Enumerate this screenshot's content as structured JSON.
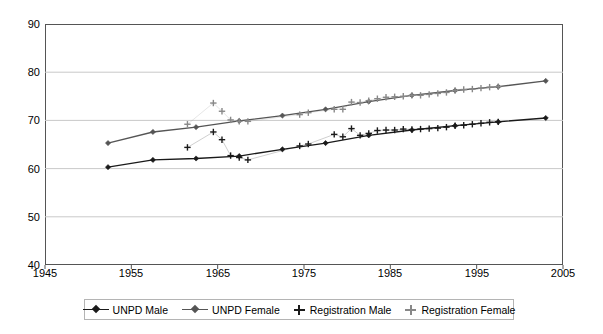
{
  "chart_data": {
    "type": "line",
    "title": "",
    "xlabel": "",
    "ylabel": "",
    "xlim": [
      1945,
      2005
    ],
    "ylim": [
      40,
      90
    ],
    "xticks": [
      1945,
      1955,
      1965,
      1975,
      1985,
      1995,
      2005
    ],
    "yticks": [
      40,
      50,
      60,
      70,
      80,
      90
    ],
    "grid": "horizontal",
    "legend_position": "bottom",
    "series": [
      {
        "name": "UNPD Male",
        "marker": "diamond",
        "color": "#1a1a1a",
        "style": "line+marker",
        "points": [
          [
            1952.3,
            60.3
          ],
          [
            1957.5,
            61.8
          ],
          [
            1962.5,
            62.1
          ],
          [
            1967.5,
            62.6
          ],
          [
            1972.5,
            64.0
          ],
          [
            1977.5,
            65.3
          ],
          [
            1982.5,
            66.9
          ],
          [
            1987.5,
            68.0
          ],
          [
            1992.5,
            68.9
          ],
          [
            1997.5,
            69.7
          ],
          [
            2003.0,
            70.5
          ]
        ]
      },
      {
        "name": "UNPD Female",
        "marker": "diamond",
        "color": "#555555",
        "style": "line+marker",
        "points": [
          [
            1952.3,
            65.3
          ],
          [
            1957.5,
            67.6
          ],
          [
            1962.5,
            68.6
          ],
          [
            1967.5,
            69.9
          ],
          [
            1972.5,
            71.0
          ],
          [
            1977.5,
            72.3
          ],
          [
            1982.5,
            73.9
          ],
          [
            1987.5,
            75.2
          ],
          [
            1992.5,
            76.2
          ],
          [
            1997.5,
            77.0
          ],
          [
            2003.0,
            78.2
          ]
        ]
      },
      {
        "name": "Registration Male",
        "marker": "plus",
        "color": "#1a1a1a",
        "style": "marker+thinline",
        "points": [
          [
            1961.5,
            64.4
          ],
          [
            1964.5,
            67.6
          ],
          [
            1965.5,
            66.0
          ],
          [
            1966.5,
            62.7
          ],
          [
            1967.5,
            62.3
          ],
          [
            1968.5,
            61.8
          ],
          [
            1974.5,
            64.7
          ],
          [
            1975.5,
            65.1
          ],
          [
            1978.5,
            67.1
          ],
          [
            1979.5,
            66.6
          ],
          [
            1980.5,
            68.3
          ],
          [
            1981.5,
            66.9
          ],
          [
            1982.5,
            67.3
          ],
          [
            1983.5,
            67.9
          ],
          [
            1984.5,
            68.0
          ],
          [
            1985.5,
            68.0
          ],
          [
            1986.5,
            68.2
          ],
          [
            1987.5,
            68.1
          ],
          [
            1988.5,
            68.2
          ],
          [
            1989.5,
            68.3
          ],
          [
            1990.5,
            68.4
          ],
          [
            1991.5,
            68.6
          ],
          [
            1992.5,
            68.9
          ],
          [
            1993.5,
            69.0
          ],
          [
            1994.5,
            69.2
          ],
          [
            1995.5,
            69.4
          ],
          [
            1996.5,
            69.6
          ],
          [
            1997.5,
            69.7
          ]
        ]
      },
      {
        "name": "Registration Female",
        "marker": "plus",
        "color": "#888888",
        "style": "marker+thinline",
        "points": [
          [
            1961.5,
            69.2
          ],
          [
            1964.5,
            73.6
          ],
          [
            1965.5,
            71.9
          ],
          [
            1966.5,
            70.1
          ],
          [
            1967.5,
            69.8
          ],
          [
            1968.5,
            69.8
          ],
          [
            1974.5,
            71.2
          ],
          [
            1975.5,
            71.6
          ],
          [
            1978.5,
            72.3
          ],
          [
            1979.5,
            72.3
          ],
          [
            1980.5,
            73.8
          ],
          [
            1981.5,
            73.7
          ],
          [
            1982.5,
            74.1
          ],
          [
            1983.5,
            74.5
          ],
          [
            1984.5,
            74.8
          ],
          [
            1985.5,
            74.9
          ],
          [
            1986.5,
            75.0
          ],
          [
            1987.5,
            75.2
          ],
          [
            1988.5,
            75.2
          ],
          [
            1989.5,
            75.4
          ],
          [
            1990.5,
            75.6
          ],
          [
            1991.5,
            75.8
          ],
          [
            1992.5,
            76.2
          ],
          [
            1993.5,
            76.4
          ],
          [
            1994.5,
            76.5
          ],
          [
            1995.5,
            76.7
          ],
          [
            1996.5,
            76.9
          ],
          [
            1997.5,
            77.0
          ]
        ]
      }
    ]
  },
  "axes": {
    "y_tick_labels": [
      "90",
      "80",
      "70",
      "60",
      "50",
      "40"
    ],
    "x_tick_labels": [
      "1945",
      "1955",
      "1965",
      "1975",
      "1985",
      "1995",
      "2005"
    ]
  },
  "legend": {
    "items": [
      {
        "label": "UNPD Male",
        "marker": "diamond-line",
        "color": "#1a1a1a"
      },
      {
        "label": "UNPD Female",
        "marker": "diamond-line",
        "color": "#555555"
      },
      {
        "label": "Registration Male",
        "marker": "plus",
        "color": "#1a1a1a"
      },
      {
        "label": "Registration Female",
        "marker": "plus",
        "color": "#888888"
      }
    ]
  }
}
